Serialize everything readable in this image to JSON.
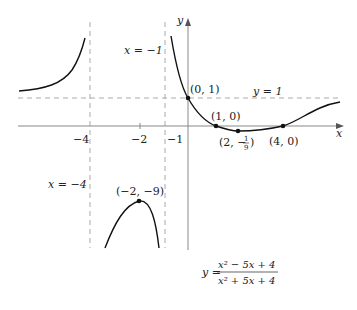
{
  "figure": {
    "function_label": {
      "lhs": "y =",
      "numerator": "x² − 5x + 4",
      "denominator": "x² + 5x + 4"
    },
    "axes": {
      "x_label": "x",
      "y_label": "y",
      "x_ticks": [
        "−4",
        "−2",
        "−1"
      ]
    },
    "asymptotes": {
      "vertical_1": "x = −4",
      "vertical_2": "x = −1",
      "horizontal": "y = 1"
    },
    "points": {
      "p_local_max": "(−2, −9)",
      "p_y_intercept": "(0, 1)",
      "p_root_1": "(1, 0)",
      "p_min_prefix": "(2, −",
      "p_min_num": "1",
      "p_min_den": "9",
      "p_min_suffix": ")",
      "p_root_2": "(4, 0)"
    }
  },
  "colors": {
    "curve": "#111111",
    "axis": "#888888",
    "asymptote": "#aaaaaa"
  }
}
